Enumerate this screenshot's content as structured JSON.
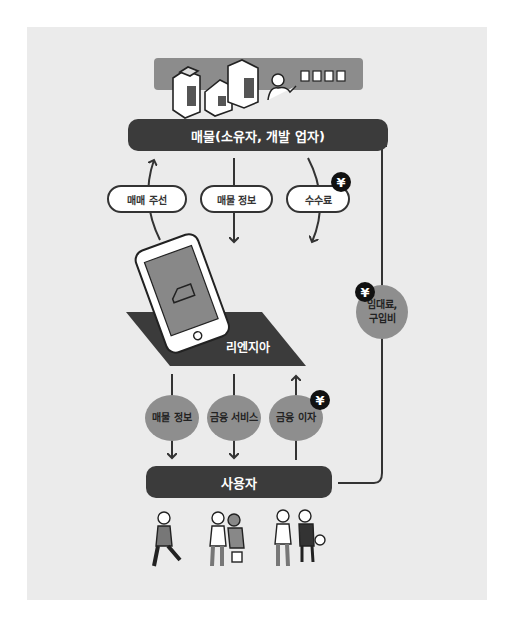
{
  "diagram": {
    "top_group": {
      "label": "매물(소유자, 개발 업자)",
      "band_color": "#8c8c8c",
      "icons": [
        "building-icon",
        "building-icon",
        "building-icon",
        "agent-person-icon",
        "document-icon"
      ]
    },
    "flows_top": [
      {
        "label": "매매 주선",
        "direction": "up"
      },
      {
        "label": "매물 정보",
        "direction": "down"
      },
      {
        "label": "수수료",
        "direction": "down",
        "currency": "¥"
      }
    ],
    "platform": {
      "label": "리엔지아",
      "icon": "smartphone-house-icon"
    },
    "flows_bottom": [
      {
        "label": "매물 정보",
        "direction": "down"
      },
      {
        "label": "금융 서비스",
        "direction": "down"
      },
      {
        "label": "금융 이자",
        "direction": "up",
        "currency": "¥"
      }
    ],
    "side_flow": {
      "label_line1": "임대료,",
      "label_line2": "구입비",
      "currency": "¥",
      "direction": "up"
    },
    "users": {
      "label": "사용자",
      "icons": [
        "user-person-icon",
        "user-couple-icon",
        "user-family-icon"
      ]
    },
    "colors": {
      "panel": "#ebebeb",
      "bar": "#3b3b3b",
      "ellipse": "#8e8e8e",
      "yen_badge": "#111111"
    }
  }
}
